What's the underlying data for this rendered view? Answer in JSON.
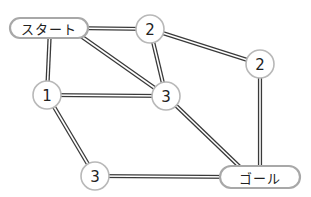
{
  "diagram": {
    "type": "weighted-graph",
    "nodes": [
      {
        "id": "start",
        "label": "スタート",
        "kind": "terminal"
      },
      {
        "id": "n2a",
        "label": "2",
        "kind": "weight"
      },
      {
        "id": "n2b",
        "label": "2",
        "kind": "weight"
      },
      {
        "id": "n1",
        "label": "1",
        "kind": "weight"
      },
      {
        "id": "n3a",
        "label": "3",
        "kind": "weight"
      },
      {
        "id": "n3b",
        "label": "3",
        "kind": "weight"
      },
      {
        "id": "goal",
        "label": "ゴール",
        "kind": "terminal"
      }
    ],
    "edges": [
      {
        "from": "start",
        "to": "n2a"
      },
      {
        "from": "start",
        "to": "n1"
      },
      {
        "from": "start",
        "to": "n3a"
      },
      {
        "from": "n2a",
        "to": "n3a"
      },
      {
        "from": "n2a",
        "to": "n2b"
      },
      {
        "from": "n2b",
        "to": "goal"
      },
      {
        "from": "n1",
        "to": "n3a"
      },
      {
        "from": "n1",
        "to": "n3b"
      },
      {
        "from": "n3a",
        "to": "goal"
      },
      {
        "from": "n3b",
        "to": "goal"
      }
    ]
  },
  "colors": {
    "edge": "#3a3a3a",
    "node_border": "#b8b8b8",
    "text": "#222222",
    "background": "#ffffff"
  }
}
